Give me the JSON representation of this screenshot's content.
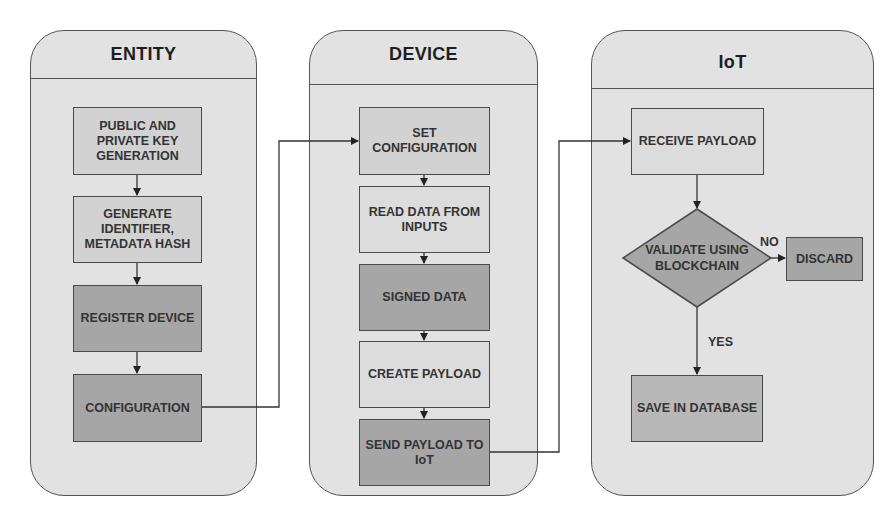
{
  "diagram": {
    "type": "swimlane-flowchart",
    "lanes": [
      {
        "title": "ENTITY",
        "steps": [
          {
            "label": "PUBLIC AND\nPRIVATE KEY\nGENERATION",
            "fill": "#d2d2d2"
          },
          {
            "label": "GENERATE\nIDENTIFIER,\nMETADATA HASH",
            "fill": "#d2d2d2"
          },
          {
            "label": "REGISTER DEVICE",
            "fill": "#a6a6a6"
          },
          {
            "label": "CONFIGURATION",
            "fill": "#a6a6a6"
          }
        ]
      },
      {
        "title": "DEVICE",
        "steps": [
          {
            "label": "SET\nCONFIGURATION",
            "fill": "#d2d2d2"
          },
          {
            "label": "READ DATA FROM\nINPUTS",
            "fill": "#dcdcdc"
          },
          {
            "label": "SIGNED DATA",
            "fill": "#a6a6a6"
          },
          {
            "label": "CREATE PAYLOAD",
            "fill": "#dcdcdc"
          },
          {
            "label": "SEND PAYLOAD TO\nIoT",
            "fill": "#a6a6a6"
          }
        ]
      },
      {
        "title": "IoT",
        "steps": [
          {
            "label": "RECEIVE PAYLOAD",
            "fill": "#dcdcdc"
          },
          {
            "label": "VALIDATE USING\nBLOCKCHAIN",
            "shape": "diamond",
            "fill": "#a6a6a6"
          },
          {
            "label": "DISCARD",
            "fill": "#a6a6a6"
          },
          {
            "label": "SAVE IN DATABASE",
            "fill": "#b8b8b8"
          }
        ],
        "branches": {
          "no": "NO",
          "yes": "YES"
        }
      }
    ],
    "edges": [
      {
        "from": "PUBLIC AND PRIVATE KEY GENERATION",
        "to": "GENERATE IDENTIFIER, METADATA HASH"
      },
      {
        "from": "GENERATE IDENTIFIER, METADATA HASH",
        "to": "REGISTER DEVICE"
      },
      {
        "from": "REGISTER DEVICE",
        "to": "CONFIGURATION"
      },
      {
        "from": "CONFIGURATION",
        "to": "SET CONFIGURATION"
      },
      {
        "from": "SET CONFIGURATION",
        "to": "READ DATA FROM INPUTS"
      },
      {
        "from": "READ DATA FROM INPUTS",
        "to": "SIGNED DATA"
      },
      {
        "from": "SIGNED DATA",
        "to": "CREATE PAYLOAD"
      },
      {
        "from": "CREATE PAYLOAD",
        "to": "SEND PAYLOAD TO IoT"
      },
      {
        "from": "SEND PAYLOAD TO IoT",
        "to": "RECEIVE PAYLOAD"
      },
      {
        "from": "RECEIVE PAYLOAD",
        "to": "VALIDATE USING BLOCKCHAIN"
      },
      {
        "from": "VALIDATE USING BLOCKCHAIN",
        "to": "DISCARD",
        "label": "NO"
      },
      {
        "from": "VALIDATE USING BLOCKCHAIN",
        "to": "SAVE IN DATABASE",
        "label": "YES"
      }
    ]
  }
}
